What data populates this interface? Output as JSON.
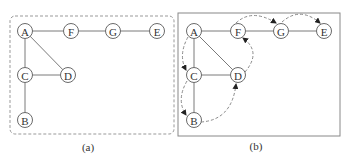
{
  "figure": {
    "panels": [
      {
        "id": "a",
        "caption": "(a)",
        "frame": "dashed",
        "nodes": {
          "A": "A",
          "F": "F",
          "G": "G",
          "E": "E",
          "C": "C",
          "D": "D",
          "B": "B"
        },
        "edges": [
          [
            "A",
            "F"
          ],
          [
            "F",
            "G"
          ],
          [
            "G",
            "E"
          ],
          [
            "A",
            "C"
          ],
          [
            "A",
            "D"
          ],
          [
            "C",
            "D"
          ],
          [
            "C",
            "B"
          ]
        ]
      },
      {
        "id": "b",
        "caption": "(b)",
        "frame": "solid",
        "nodes": {
          "A": "A",
          "F": "F",
          "G": "G",
          "E": "E",
          "C": "C",
          "D": "D",
          "B": "B"
        },
        "edges": [
          [
            "A",
            "F"
          ],
          [
            "F",
            "G"
          ],
          [
            "G",
            "E"
          ],
          [
            "A",
            "C"
          ],
          [
            "A",
            "D"
          ],
          [
            "C",
            "D"
          ],
          [
            "C",
            "B"
          ]
        ],
        "traversal_order": [
          "A",
          "C",
          "B",
          "D",
          "F",
          "G",
          "E"
        ]
      }
    ],
    "colors": {
      "stroke": "#7a7a7a",
      "text": "#333333",
      "background": "#ffffff"
    }
  }
}
